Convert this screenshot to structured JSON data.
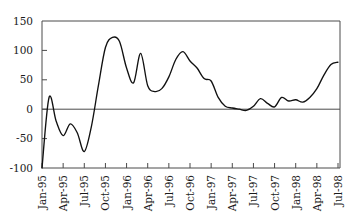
{
  "chart_data": {
    "type": "line",
    "title": "",
    "subtitle": "",
    "xlabel": "",
    "ylabel": "",
    "xlim": [
      "Jan-95",
      "Jul-98"
    ],
    "ylim": [
      -100,
      150
    ],
    "yticks": [
      150,
      100,
      50,
      0,
      -50,
      -100
    ],
    "ytick_labels": [
      "150",
      "100",
      "50",
      "0",
      "-50",
      "-100"
    ],
    "grid": false,
    "legend": null,
    "zero_line": 0,
    "categories": [
      "Jan-95",
      "Feb-95",
      "Mar-95",
      "Apr-95",
      "May-95",
      "Jun-95",
      "Jul-95",
      "Aug-95",
      "Sep-95",
      "Oct-95",
      "Nov-95",
      "Dec-95",
      "Jan-96",
      "Feb-96",
      "Mar-96",
      "Apr-96",
      "May-96",
      "Jun-96",
      "Jul-96",
      "Aug-96",
      "Sep-96",
      "Oct-96",
      "Nov-96",
      "Dec-96",
      "Jan-97",
      "Feb-97",
      "Mar-97",
      "Apr-97",
      "May-97",
      "Jun-97",
      "Jul-97",
      "Aug-97",
      "Sep-97",
      "Oct-97",
      "Nov-97",
      "Dec-97",
      "Jan-98",
      "Feb-98",
      "Mar-98",
      "Apr-98",
      "May-98",
      "Jun-98",
      "Jul-98"
    ],
    "xtick_labels": [
      "Jan-95",
      "Apr-95",
      "Jul-95",
      "Oct-95",
      "Jan-96",
      "Apr-96",
      "Jul-96",
      "Oct-96",
      "Jan-97",
      "Apr-97",
      "Jul-97",
      "Oct-97",
      "Jan-98",
      "Apr-98",
      "Jul-98"
    ],
    "values": [
      -100,
      20,
      -20,
      -45,
      -25,
      -40,
      -72,
      -30,
      40,
      105,
      122,
      115,
      70,
      45,
      95,
      40,
      30,
      35,
      55,
      85,
      98,
      82,
      70,
      52,
      48,
      20,
      5,
      2,
      0,
      -2,
      5,
      18,
      10,
      4,
      20,
      14,
      16,
      12,
      20,
      35,
      58,
      76,
      80
    ],
    "series": [
      {
        "name": "series-1",
        "color": "#111111",
        "values": [
          -100,
          20,
          -20,
          -45,
          -25,
          -40,
          -72,
          -30,
          40,
          105,
          122,
          115,
          70,
          45,
          95,
          40,
          30,
          35,
          55,
          85,
          98,
          82,
          70,
          52,
          48,
          20,
          5,
          2,
          0,
          -2,
          5,
          18,
          10,
          4,
          20,
          14,
          16,
          12,
          20,
          35,
          58,
          76,
          80
        ]
      }
    ],
    "axis_color": "#4a4a4a",
    "line_color": "#111111",
    "background": "#ffffff"
  },
  "geometry": {
    "plot_left": 42,
    "plot_right": 340,
    "plot_top": 21,
    "plot_bottom": 168
  }
}
